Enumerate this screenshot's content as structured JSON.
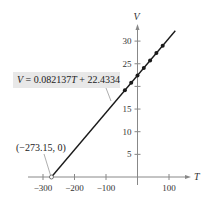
{
  "chart_data": {
    "type": "line",
    "title": "",
    "xlabel": "T",
    "ylabel": "V",
    "xlim": [
      -330,
      120
    ],
    "ylim": [
      0,
      33
    ],
    "x_ticks": [
      -300,
      -200,
      -100,
      100
    ],
    "x_tick_labels": [
      "−300",
      "−200",
      "−100",
      "100"
    ],
    "y_ticks": [
      5,
      10,
      15,
      20,
      25,
      30
    ],
    "y_tick_labels": [
      "5",
      "10",
      "15",
      "",
      "25",
      "30"
    ],
    "grid": false,
    "series": [
      {
        "name": "V = 0.082137T + 22.4334",
        "kind": "line",
        "slope": 0.082137,
        "intercept": 22.4334,
        "x_range": [
          -273.15,
          120
        ]
      },
      {
        "name": "data points",
        "kind": "scatter",
        "x": [
          -40,
          -20,
          0,
          20,
          40,
          60,
          80
        ],
        "y": [
          19.15,
          20.79,
          22.43,
          24.07,
          25.72,
          27.36,
          29.0
        ]
      }
    ],
    "annotations": [
      {
        "text": "V = 0.082137T + 22.4334",
        "boxed": true
      },
      {
        "text": "(−273.15, 0)",
        "point": [
          -273.15,
          0
        ],
        "open_circle": true
      }
    ]
  },
  "labels": {
    "equation_var": "V",
    "equation_rest": " = 0.082137",
    "equation_T": "T",
    "equation_tail": " + 22.4334",
    "intercept_point": "(−273.15, 0)",
    "x_axis": "T",
    "y_axis": "V"
  }
}
